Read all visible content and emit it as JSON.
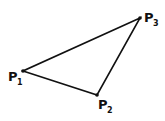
{
  "diagram": {
    "type": "triangle",
    "stroke_color": "#111111",
    "background": "#ffffff",
    "points": [
      {
        "id": "P1",
        "letter": "P",
        "sub": "1",
        "x": 23,
        "y": 71
      },
      {
        "id": "P2",
        "letter": "P",
        "sub": "2",
        "x": 97,
        "y": 95
      },
      {
        "id": "P3",
        "letter": "P",
        "sub": "3",
        "x": 140,
        "y": 18
      }
    ],
    "edges": [
      [
        "P1",
        "P2"
      ],
      [
        "P2",
        "P3"
      ],
      [
        "P3",
        "P1"
      ]
    ]
  }
}
